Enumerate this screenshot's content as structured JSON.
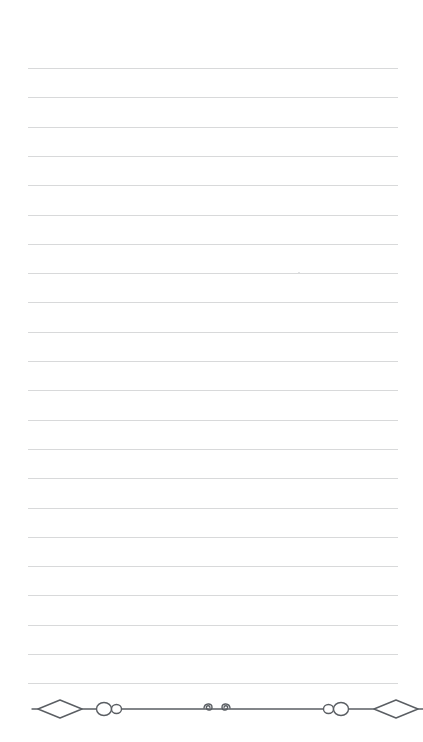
{
  "page": {
    "kind": "lined-notepaper",
    "width": 423,
    "height": 742,
    "background_color": "#ffffff",
    "text_content": "",
    "body_text": ""
  },
  "rules": {
    "label": "ruled writing lines",
    "line_color": "#d8d9da",
    "line_thickness_px": 1,
    "left_x": 28,
    "right_x": 398,
    "first_line_y": 68,
    "spacing_px": 29.3,
    "count": 22,
    "line_y_positions": [
      68,
      97.3,
      126.6,
      155.9,
      185.2,
      214.5,
      243.8,
      273.1,
      302.4,
      331.7,
      361,
      390.3,
      419.6,
      448.9,
      478.2,
      507.5,
      536.8,
      566.1,
      595.4,
      624.7,
      654,
      683.3
    ]
  },
  "marks": [
    {
      "name": "stray-speck",
      "x": 298,
      "y": 272,
      "color": "#d9dadb"
    }
  ],
  "ornament": {
    "label": "decorative divider",
    "center_y": 709,
    "stroke_color": "#5a5e63",
    "stroke_width": 1.4,
    "left_end_x": 32,
    "right_end_x": 423,
    "elements": [
      {
        "name": "left-diamond",
        "type": "diamond",
        "cx": 60,
        "rx": 22,
        "ry": 9
      },
      {
        "name": "left-large-circle",
        "type": "circle",
        "cx": 104,
        "rx": 7.5,
        "ry": 6.5
      },
      {
        "name": "left-small-circle",
        "type": "circle",
        "cx": 116.5,
        "rx": 5,
        "ry": 4.5
      },
      {
        "name": "center-spiral-left",
        "type": "spiral",
        "cx": 210
      },
      {
        "name": "center-spiral-right",
        "type": "spiral",
        "cx": 224
      },
      {
        "name": "right-small-circle",
        "type": "circle",
        "cx": 328.5,
        "rx": 5,
        "ry": 4.5
      },
      {
        "name": "right-large-circle",
        "type": "circle",
        "cx": 341,
        "rx": 7.5,
        "ry": 6.5
      },
      {
        "name": "right-diamond",
        "type": "diamond",
        "cx": 396,
        "rx": 22,
        "ry": 9
      }
    ]
  }
}
